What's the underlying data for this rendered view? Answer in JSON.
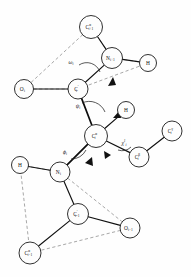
{
  "figure": {
    "background_color": "#ffffff",
    "bond_color": "#111111",
    "dashed_color": "#8a8a8a",
    "atom_fill": "#fdfdfd"
  },
  "atoms": [
    {
      "id": "ca_ip1",
      "base": "C",
      "sup": "α",
      "sub": "i+1",
      "cx": 91,
      "cy": 27,
      "r": 11.5
    },
    {
      "id": "n_ip1",
      "base": "N",
      "sup": "",
      "sub": "i+1",
      "cx": 112,
      "cy": 58,
      "r": 10.5
    },
    {
      "id": "h_top",
      "base": "H",
      "sup": "",
      "sub": "",
      "cx": 148,
      "cy": 63,
      "r": 8.5
    },
    {
      "id": "o_i",
      "base": "O",
      "sup": "",
      "sub": "i",
      "cx": 24,
      "cy": 89,
      "r": 9.5
    },
    {
      "id": "cprime_i",
      "base": "C",
      "sup": "′",
      "sub": "i",
      "cx": 78,
      "cy": 89,
      "r": 10.0
    },
    {
      "id": "h_mid",
      "base": "H",
      "sup": "",
      "sub": "",
      "cx": 126,
      "cy": 110,
      "r": 8.5
    },
    {
      "id": "ca_i",
      "base": "C",
      "sup": "α",
      "sub": "i",
      "cx": 96,
      "cy": 136,
      "r": 11.5
    },
    {
      "id": "cb_i",
      "base": "C",
      "sup": "β",
      "sub": "i",
      "cx": 139,
      "cy": 157,
      "r": 10.0
    },
    {
      "id": "cg_i",
      "base": "C",
      "sup": "γ",
      "sub": "i",
      "cx": 172,
      "cy": 131,
      "r": 10.0
    },
    {
      "id": "h_low",
      "base": "H",
      "sup": "",
      "sub": "",
      "cx": 20,
      "cy": 165,
      "r": 8.5
    },
    {
      "id": "n_i",
      "base": "N",
      "sup": "",
      "sub": "i",
      "cx": 60,
      "cy": 172,
      "r": 10.0
    },
    {
      "id": "cprime_im1",
      "base": "C",
      "sup": "′",
      "sub": "i−1",
      "cx": 78,
      "cy": 214,
      "r": 10.5
    },
    {
      "id": "o_im1",
      "base": "O",
      "sup": "",
      "sub": "i−1",
      "cx": 130,
      "cy": 228,
      "r": 10.0
    },
    {
      "id": "ca_im1",
      "base": "C",
      "sup": "α",
      "sub": "i−1",
      "cx": 30,
      "cy": 253,
      "r": 11.0
    }
  ],
  "bonds": [
    {
      "from": "ca_ip1",
      "to": "n_ip1",
      "style": "solid"
    },
    {
      "from": "n_ip1",
      "to": "h_top",
      "style": "solid"
    },
    {
      "from": "n_ip1",
      "to": "cprime_i",
      "style": "solid"
    },
    {
      "from": "o_i",
      "to": "cprime_i",
      "style": "solid"
    },
    {
      "from": "cprime_i",
      "to": "ca_i",
      "style": "thick"
    },
    {
      "from": "ca_i",
      "to": "h_mid",
      "style": "solid"
    },
    {
      "from": "ca_i",
      "to": "cb_i",
      "style": "solid"
    },
    {
      "from": "cb_i",
      "to": "cg_i",
      "style": "solid"
    },
    {
      "from": "ca_i",
      "to": "n_i",
      "style": "thick"
    },
    {
      "from": "n_i",
      "to": "h_low",
      "style": "solid"
    },
    {
      "from": "n_i",
      "to": "cprime_im1",
      "style": "solid"
    },
    {
      "from": "cprime_im1",
      "to": "o_im1",
      "style": "solid"
    },
    {
      "from": "cprime_im1",
      "to": "ca_im1",
      "style": "solid"
    }
  ],
  "plane_outlines": [
    {
      "name": "upper-peptide-plane",
      "points": "91,27 24,89 78,89 148,63 112,58"
    },
    {
      "name": "lower-peptide-plane",
      "points": "20,165 60,172 130,228 30,253"
    }
  ],
  "angles": [
    {
      "id": "omega_i",
      "label": "ω",
      "sub": "i",
      "lx": 71,
      "ly": 62,
      "arc": "M 79 65 A 14 14 0 0 1 100 72",
      "arrow": "113,77 108,86 116,85"
    },
    {
      "id": "psi_i",
      "label": "ψ",
      "sub": "i",
      "lx": 78,
      "ly": 106,
      "arc": "M 82 103 A 17 17 0 0 1 105 112",
      "arrow": "120,110 113,118 121,118"
    },
    {
      "id": "phi_i",
      "label": "ϕ",
      "sub": "i",
      "lx": 65,
      "ly": 152,
      "arc": "M 71 159 A 16 16 0 0 0 86 150",
      "arrow": "92,157 85,163 93,166"
    },
    {
      "id": "chi1_i",
      "label": "χ",
      "sup": "1",
      "sub": "i",
      "lx": 124,
      "ly": 143,
      "arc": "M 118 150 A 13 13 0 0 0 131 147",
      "arrow": "111,155 104,151 105,159"
    }
  ],
  "legend": {
    "note": "Torsion angles labelled: omega-i, psi-i, phi-i, chi-1-i"
  }
}
